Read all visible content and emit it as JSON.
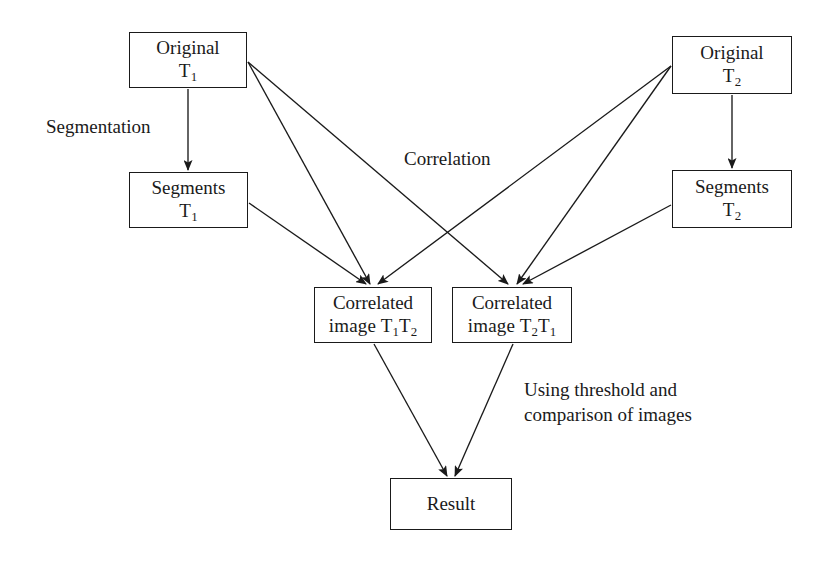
{
  "diagram": {
    "type": "flowchart",
    "canvas": {
      "width": 826,
      "height": 564
    },
    "stroke_color": "#1a1a1a",
    "background_color": "#ffffff",
    "nodes": [
      {
        "id": "original-t1",
        "name": "original-t1-box",
        "line1": "Original",
        "line2_main": "T",
        "line2_sub": "1",
        "x": 129,
        "y": 32,
        "w": 118,
        "h": 56
      },
      {
        "id": "original-t2",
        "name": "original-t2-box",
        "line1": "Original",
        "line2_main": "T",
        "line2_sub": "2",
        "x": 672,
        "y": 36,
        "w": 120,
        "h": 58
      },
      {
        "id": "segments-t1",
        "name": "segments-t1-box",
        "line1": "Segments",
        "line2_main": "T",
        "line2_sub": "1",
        "x": 129,
        "y": 172,
        "w": 119,
        "h": 56
      },
      {
        "id": "segments-t2",
        "name": "segments-t2-box",
        "line1": "Segments",
        "line2_main": "T",
        "line2_sub": "2",
        "x": 672,
        "y": 170,
        "w": 120,
        "h": 58
      },
      {
        "id": "correlated-t1t2",
        "name": "correlated-image-t1t2-box",
        "line1": "Correlated",
        "line2_prefix": "image ",
        "line2_main1": "T",
        "line2_sub1": "1",
        "line2_main2": "T",
        "line2_sub2": "2",
        "x": 314,
        "y": 287,
        "w": 118,
        "h": 56
      },
      {
        "id": "correlated-t2t1",
        "name": "correlated-image-t2t1-box",
        "line1": "Correlated",
        "line2_prefix": "image ",
        "line2_main1": "T",
        "line2_sub1": "2",
        "line2_main2": "T",
        "line2_sub2": "1",
        "x": 452,
        "y": 287,
        "w": 120,
        "h": 56
      },
      {
        "id": "result",
        "name": "result-box",
        "line1": "Result",
        "x": 390,
        "y": 478,
        "w": 122,
        "h": 52
      }
    ],
    "labels": [
      {
        "id": "segmentation-label",
        "name": "segmentation-label",
        "text": "Segmentation",
        "x": 46,
        "y": 115
      },
      {
        "id": "correlation-label",
        "name": "correlation-label",
        "text": "Correlation",
        "x": 404,
        "y": 147
      },
      {
        "id": "threshold-label",
        "name": "using-threshold-label",
        "text": "Using threshold and\ncomparison of images",
        "x": 524,
        "y": 378
      }
    ],
    "edges": [
      {
        "id": "e-orig-t1-to-seg-t1",
        "name": "arrow-original-t1-to-segments-t1",
        "from": "original-t1",
        "to": "segments-t1",
        "x1": 188,
        "y1": 89,
        "x2": 188,
        "y2": 170
      },
      {
        "id": "e-orig-t2-to-seg-t2",
        "name": "arrow-original-t2-to-segments-t2",
        "from": "original-t2",
        "to": "segments-t2",
        "x1": 732,
        "y1": 95,
        "x2": 732,
        "y2": 168
      },
      {
        "id": "e-orig-t1-to-corr-a",
        "name": "arrow-original-t1-to-correlated-t1t2",
        "from": "original-t1",
        "to": "correlated-t1t2",
        "x1": 248,
        "y1": 62,
        "x2": 370,
        "y2": 284
      },
      {
        "id": "e-orig-t1-to-corr-b",
        "name": "arrow-original-t1-to-correlated-t2t1",
        "from": "original-t1",
        "to": "correlated-t2t1",
        "x1": 248,
        "y1": 62,
        "x2": 508,
        "y2": 284
      },
      {
        "id": "e-seg-t1-to-corr",
        "name": "arrow-segments-t1-to-correlated-t1t2",
        "from": "segments-t1",
        "to": "correlated-t1t2",
        "x1": 249,
        "y1": 203,
        "x2": 366,
        "y2": 284
      },
      {
        "id": "e-orig-t2-to-corr-a",
        "name": "arrow-original-t2-to-correlated-t2t1",
        "from": "original-t2",
        "to": "correlated-t2t1",
        "x1": 671,
        "y1": 66,
        "x2": 517,
        "y2": 284
      },
      {
        "id": "e-orig-t2-to-corr-b",
        "name": "arrow-original-t2-to-correlated-t1t2",
        "from": "original-t2",
        "to": "correlated-t1t2",
        "x1": 671,
        "y1": 66,
        "x2": 378,
        "y2": 284
      },
      {
        "id": "e-seg-t2-to-corr",
        "name": "arrow-segments-t2-to-correlated-t2t1",
        "from": "segments-t2",
        "to": "correlated-t2t1",
        "x1": 671,
        "y1": 205,
        "x2": 523,
        "y2": 284
      },
      {
        "id": "e-corr-a-to-result",
        "name": "arrow-correlated-t1t2-to-result",
        "from": "correlated-t1t2",
        "to": "result",
        "x1": 374,
        "y1": 344,
        "x2": 447,
        "y2": 476
      },
      {
        "id": "e-corr-b-to-result",
        "name": "arrow-correlated-t2t1-to-result",
        "from": "correlated-t2t1",
        "to": "result",
        "x1": 513,
        "y1": 344,
        "x2": 455,
        "y2": 476
      }
    ]
  }
}
